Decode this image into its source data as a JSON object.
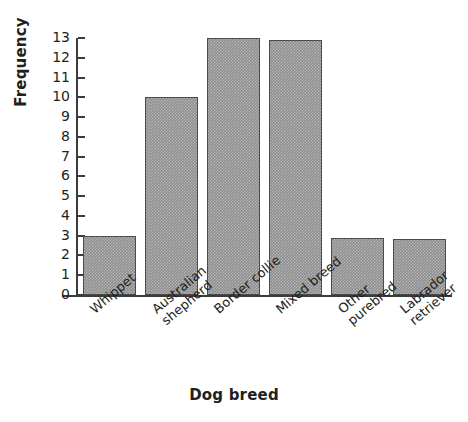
{
  "chart_data": {
    "type": "bar",
    "title": "",
    "xlabel": "Dog breed",
    "ylabel": "Frequency",
    "categories": [
      "Whippet",
      "Australian shepherd",
      "Border collie",
      "Mixed breed",
      "Other purebred",
      "Labrador retriever"
    ],
    "category_lines": [
      [
        "Whippet",
        ""
      ],
      [
        "Australian",
        "shepherd"
      ],
      [
        "Border collie",
        ""
      ],
      [
        "Mixed breed",
        ""
      ],
      [
        "Other",
        "purebred"
      ],
      [
        "Labrador",
        "retriever"
      ]
    ],
    "values": [
      3,
      10,
      13,
      12.9,
      2.9,
      2.85
    ],
    "ylim": [
      0,
      13
    ],
    "ytick_labels": [
      "13",
      "12",
      "11",
      "10",
      "9",
      "8",
      "7",
      "6",
      "5",
      "4",
      "3",
      "2",
      "1",
      "0"
    ],
    "ytick_values": [
      13,
      12,
      11,
      10,
      9,
      8,
      7,
      6,
      5,
      4,
      3,
      2,
      1,
      0
    ],
    "grid": false,
    "legend": null,
    "bar_color": "#8f8f8f",
    "bar_edge_color": "#4a4a4a",
    "axis_color": "#3b3b3b",
    "background_color": "#ffffff"
  }
}
